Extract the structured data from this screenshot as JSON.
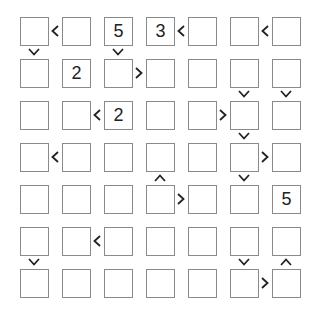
{
  "puzzle": {
    "type": "futoshiki",
    "size": 7,
    "grid": [
      [
        "",
        "",
        "5",
        "3",
        "",
        "",
        ""
      ],
      [
        "",
        "2",
        "",
        "",
        "",
        "",
        ""
      ],
      [
        "",
        "",
        "2",
        "",
        "",
        "",
        ""
      ],
      [
        "",
        "",
        "",
        "",
        "",
        "",
        ""
      ],
      [
        "",
        "",
        "",
        "",
        "",
        "",
        "5"
      ],
      [
        "",
        "",
        "",
        "",
        "",
        "",
        ""
      ],
      [
        "",
        "",
        "",
        "",
        "",
        "",
        ""
      ]
    ],
    "horizontal_signs": [
      {
        "row": 0,
        "col": 0,
        "sign": "<"
      },
      {
        "row": 0,
        "col": 3,
        "sign": "<"
      },
      {
        "row": 0,
        "col": 5,
        "sign": "<"
      },
      {
        "row": 1,
        "col": 2,
        "sign": ">"
      },
      {
        "row": 2,
        "col": 1,
        "sign": "<"
      },
      {
        "row": 2,
        "col": 4,
        "sign": ">"
      },
      {
        "row": 3,
        "col": 0,
        "sign": "<"
      },
      {
        "row": 3,
        "col": 5,
        "sign": ">"
      },
      {
        "row": 4,
        "col": 3,
        "sign": ">"
      },
      {
        "row": 5,
        "col": 1,
        "sign": "<"
      },
      {
        "row": 6,
        "col": 5,
        "sign": ">"
      }
    ],
    "vertical_signs": [
      {
        "row": 0,
        "col": 0,
        "sign": "v"
      },
      {
        "row": 0,
        "col": 2,
        "sign": "v"
      },
      {
        "row": 1,
        "col": 5,
        "sign": "v"
      },
      {
        "row": 1,
        "col": 6,
        "sign": "v"
      },
      {
        "row": 2,
        "col": 5,
        "sign": "v"
      },
      {
        "row": 3,
        "col": 3,
        "sign": "^"
      },
      {
        "row": 3,
        "col": 5,
        "sign": "v"
      },
      {
        "row": 5,
        "col": 0,
        "sign": "v"
      },
      {
        "row": 5,
        "col": 5,
        "sign": "v"
      },
      {
        "row": 5,
        "col": 6,
        "sign": "^"
      }
    ]
  }
}
